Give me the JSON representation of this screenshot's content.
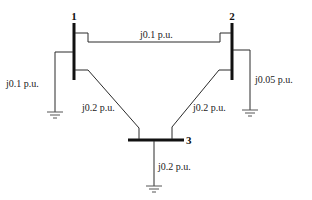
{
  "diagram": {
    "type": "three-bus power system impedance diagram",
    "buses": [
      {
        "id": "1",
        "label": "1"
      },
      {
        "id": "2",
        "label": "2"
      },
      {
        "id": "3",
        "label": "3"
      }
    ],
    "lines": [
      {
        "from": "1",
        "to": "2",
        "impedance": "j0.1 p.u."
      },
      {
        "from": "1",
        "to": "3",
        "impedance": "j0.2 p.u."
      },
      {
        "from": "2",
        "to": "3",
        "impedance": "j0.2 p.u."
      }
    ],
    "shunts": [
      {
        "bus": "1",
        "impedance": "j0.1 p.u."
      },
      {
        "bus": "2",
        "impedance": "j0.05 p.u."
      },
      {
        "bus": "3",
        "impedance": "j0.2 p.u."
      }
    ]
  }
}
